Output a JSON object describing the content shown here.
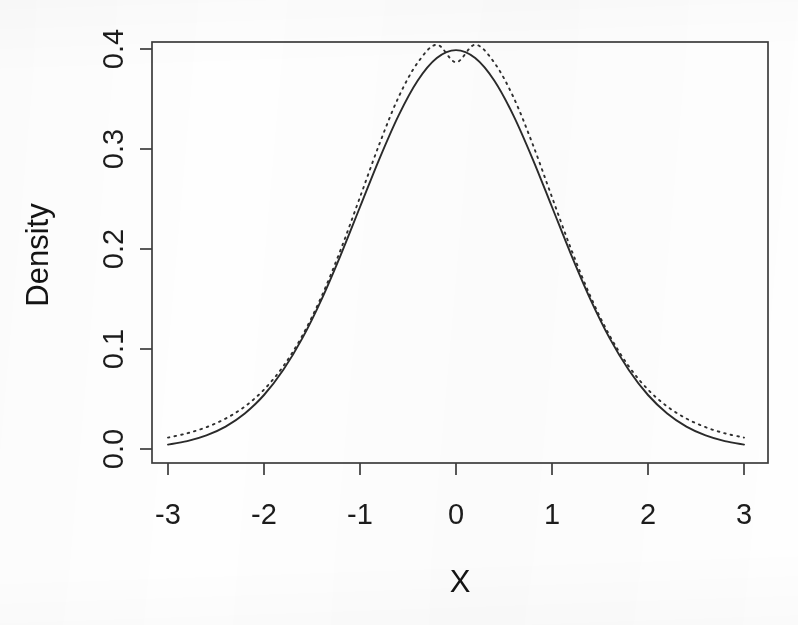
{
  "chart_data": {
    "type": "line",
    "title": "",
    "subtitle": "",
    "xlabel": "X",
    "ylabel": "Density",
    "xlim": [
      -3,
      3
    ],
    "ylim": [
      0.0,
      0.4
    ],
    "grid": false,
    "legend": null,
    "x_ticks": [
      "-3",
      "-2",
      "-1",
      "0",
      "1",
      "2",
      "3"
    ],
    "x_tick_values": [
      -3,
      -2,
      -1,
      0,
      1,
      2,
      3
    ],
    "y_ticks": [
      "0.0",
      "0.1",
      "0.2",
      "0.3",
      "0.4"
    ],
    "y_tick_values": [
      0.0,
      0.1,
      0.2,
      0.3,
      0.4
    ],
    "x": [
      -3.0,
      -2.8,
      -2.6,
      -2.4,
      -2.2,
      -2.0,
      -1.8,
      -1.6,
      -1.4,
      -1.2,
      -1.0,
      -0.8,
      -0.6,
      -0.4,
      -0.2,
      0.0,
      0.2,
      0.4,
      0.6,
      0.8,
      1.0,
      1.2,
      1.4,
      1.6,
      1.8,
      2.0,
      2.2,
      2.4,
      2.6,
      2.8,
      3.0
    ],
    "series": [
      {
        "name": "solid-curve",
        "style": "solid",
        "color": "#2a2a2a",
        "peak": 0.399,
        "values": [
          0.0044,
          0.0079,
          0.0136,
          0.0224,
          0.0355,
          0.054,
          0.079,
          0.1109,
          0.1497,
          0.1942,
          0.242,
          0.2897,
          0.3332,
          0.3683,
          0.391,
          0.3989,
          0.391,
          0.3683,
          0.3332,
          0.2897,
          0.242,
          0.1942,
          0.1497,
          0.1109,
          0.079,
          0.054,
          0.0355,
          0.0224,
          0.0136,
          0.0079,
          0.0044
        ]
      },
      {
        "name": "dotted-curve",
        "style": "dotted",
        "color": "#2f2f2f",
        "peak": 0.3867,
        "values": [
          0.0114,
          0.0157,
          0.0218,
          0.0304,
          0.0425,
          0.0594,
          0.0826,
          0.1135,
          0.1527,
          0.1996,
          0.2518,
          0.3045,
          0.3515,
          0.3862,
          0.4043,
          0.3867,
          0.4043,
          0.3862,
          0.3515,
          0.3045,
          0.2518,
          0.1996,
          0.1527,
          0.1135,
          0.0826,
          0.0594,
          0.0425,
          0.0304,
          0.0218,
          0.0157,
          0.0114
        ]
      }
    ]
  },
  "axes": {
    "y_title": "Density",
    "x_title": "X"
  }
}
